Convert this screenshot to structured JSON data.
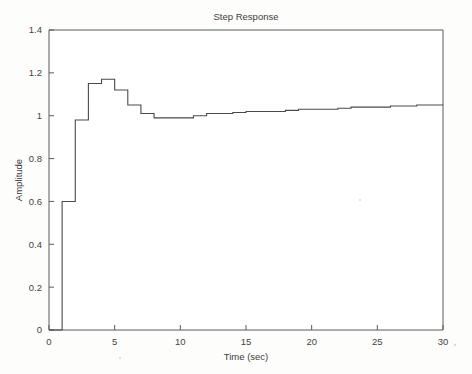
{
  "figure": {
    "window_title": "Step Response",
    "background_color": "#fdfdfc",
    "line_color": "#4a4a4a",
    "axis_color": "#5a5a5a",
    "text_color": "#3c3c3c"
  },
  "chart_data": {
    "type": "line",
    "title": "Step Response",
    "xlabel": "Time (sec)",
    "ylabel": "Amplitude",
    "xlim": [
      0,
      30
    ],
    "ylim": [
      0,
      1.4
    ],
    "xticks": [
      0,
      5,
      10,
      15,
      20,
      25,
      30
    ],
    "xtick_labels": [
      "0",
      "5",
      "10",
      "15",
      "20",
      "25",
      "30"
    ],
    "yticks": [
      0,
      0.2,
      0.4,
      0.6,
      0.8,
      1,
      1.2,
      1.4
    ],
    "ytick_labels": [
      "0",
      "0.2",
      "0.4",
      "0.6",
      "0.8",
      "1",
      "1.2",
      "1.4"
    ],
    "grid": false,
    "legend": null,
    "legend_position": "none",
    "interpolation": "zero-order-hold-staircase",
    "sample_period": 1,
    "series": [
      {
        "name": "step response",
        "x": [
          0,
          1,
          2,
          3,
          4,
          5,
          6,
          7,
          8,
          9,
          10,
          11,
          12,
          13,
          14,
          15,
          16,
          17,
          18,
          19,
          20,
          21,
          22,
          23,
          24,
          25,
          26,
          27,
          28,
          29,
          30
        ],
        "values": [
          0,
          0.6,
          0.98,
          1.15,
          1.17,
          1.12,
          1.05,
          1.01,
          0.99,
          0.99,
          0.99,
          1.0,
          1.01,
          1.01,
          1.015,
          1.02,
          1.02,
          1.02,
          1.025,
          1.03,
          1.03,
          1.03,
          1.035,
          1.04,
          1.04,
          1.04,
          1.045,
          1.045,
          1.05,
          1.05,
          1.05
        ]
      }
    ],
    "annotations": {
      "initial_value": 0,
      "first_step_value": 0.6,
      "peak_value": 1.17,
      "peak_time": 4,
      "undershoot_value": 0.99,
      "undershoot_time": 9,
      "final_value": 1.05
    }
  }
}
